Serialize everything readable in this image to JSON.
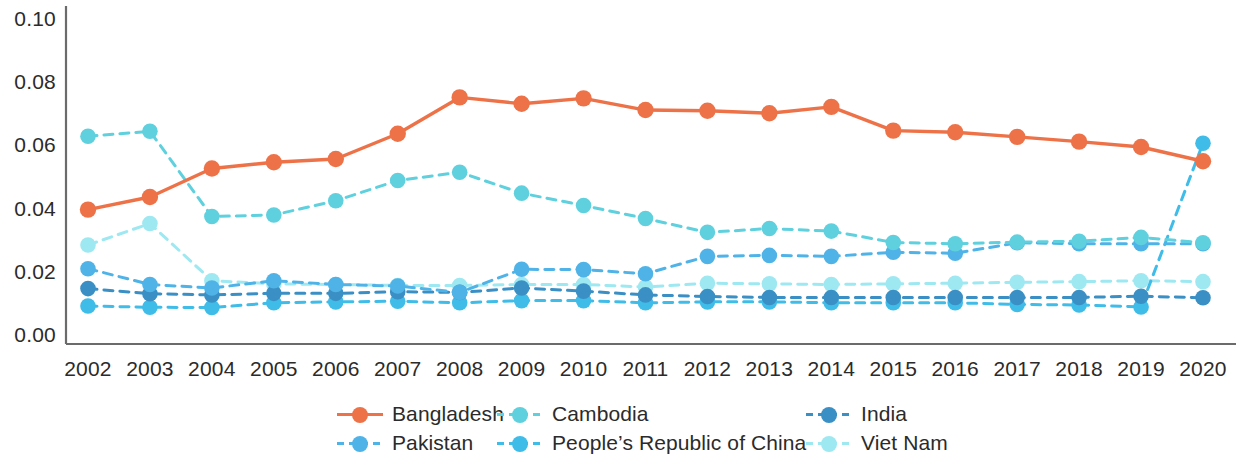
{
  "chart_data": {
    "type": "line",
    "title": "",
    "subtitle": "",
    "xlabel": "",
    "ylabel": "",
    "grid": false,
    "legend_position": "bottom",
    "x": [
      "2002",
      "2003",
      "2004",
      "2005",
      "2006",
      "2007",
      "2008",
      "2009",
      "2010",
      "2011",
      "2012",
      "2013",
      "2014",
      "2015",
      "2016",
      "2017",
      "2018",
      "2019",
      "2020"
    ],
    "categories": [
      "2002",
      "2003",
      "2004",
      "2005",
      "2006",
      "2007",
      "2008",
      "2009",
      "2010",
      "2011",
      "2012",
      "2013",
      "2014",
      "2015",
      "2016",
      "2017",
      "2018",
      "2019",
      "2020"
    ],
    "ylim": [
      0.0,
      0.1
    ],
    "yticks": [
      "0.00",
      "0.02",
      "0.04",
      "0.06",
      "0.08",
      "0.10"
    ],
    "ytick_values": [
      0.0,
      0.02,
      0.04,
      0.06,
      0.08,
      0.1
    ],
    "series": [
      {
        "name": "Bangladesh",
        "color": "#ED7248",
        "style": "solid",
        "values": [
          0.04,
          0.044,
          0.053,
          0.055,
          0.056,
          0.064,
          0.0755,
          0.0735,
          0.0752,
          0.0715,
          0.0713,
          0.0705,
          0.0725,
          0.065,
          0.0645,
          0.063,
          0.0615,
          0.0598,
          0.0553
        ]
      },
      {
        "name": "Cambodia",
        "color": "#5FD0DD",
        "style": "dashed",
        "values": [
          0.0632,
          0.0648,
          0.0378,
          0.0383,
          0.0428,
          0.0492,
          0.0518,
          0.0452,
          0.0413,
          0.0372,
          0.0328,
          0.034,
          0.0332,
          0.0296,
          0.0292,
          0.0297,
          0.03,
          0.0312,
          0.0295
        ]
      },
      {
        "name": "India",
        "color": "#3A8FC4",
        "style": "dashed",
        "values": [
          0.015,
          0.0134,
          0.013,
          0.0135,
          0.0135,
          0.014,
          0.0138,
          0.0152,
          0.0142,
          0.013,
          0.0125,
          0.0122,
          0.0122,
          0.0122,
          0.0122,
          0.0122,
          0.0122,
          0.0126,
          0.0121
        ]
      },
      {
        "name": "Pakistan",
        "color": "#4FB3E8",
        "style": "dashed",
        "values": [
          0.0213,
          0.0163,
          0.0152,
          0.0175,
          0.0163,
          0.0158,
          0.0138,
          0.0211,
          0.021,
          0.0197,
          0.0252,
          0.0255,
          0.0252,
          0.0265,
          0.0262,
          0.0295,
          0.0292,
          0.0292,
          0.0292
        ]
      },
      {
        "name": "People's Republic of China",
        "color": "#3FBCE8",
        "style": "dashed",
        "values": [
          0.0095,
          0.0091,
          0.009,
          0.0105,
          0.0108,
          0.011,
          0.0105,
          0.0112,
          0.0112,
          0.0105,
          0.0108,
          0.0108,
          0.0105,
          0.0105,
          0.0105,
          0.01,
          0.0098,
          0.0092,
          0.061
        ]
      },
      {
        "name": "Viet Nam",
        "color": "#9EE8F2",
        "style": "dashed",
        "values": [
          0.0288,
          0.0356,
          0.0175,
          0.0165,
          0.0163,
          0.016,
          0.016,
          0.0163,
          0.0163,
          0.0155,
          0.0167,
          0.0165,
          0.0163,
          0.0165,
          0.0167,
          0.017,
          0.0172,
          0.0175,
          0.0172
        ]
      }
    ]
  },
  "legend": {
    "rows": [
      [
        {
          "label": "Bangladesh",
          "color": "#ED7248",
          "style": "solid",
          "x": 337,
          "w": 180
        },
        {
          "label": "Cambodia",
          "color": "#5FD0DD",
          "style": "dashed",
          "x": 497,
          "w": 190
        },
        {
          "label": "India",
          "color": "#3A8FC4",
          "style": "dashed",
          "x": 806,
          "w": 140
        }
      ],
      [
        {
          "label": "Pakistan",
          "color": "#4FB3E8",
          "style": "dashed",
          "x": 337,
          "w": 180
        },
        {
          "label": "People’s Republic of China",
          "color": "#3FBCE8",
          "style": "dashed",
          "x": 497,
          "w": 330
        },
        {
          "label": "Viet Nam",
          "color": "#9EE8F2",
          "style": "dashed",
          "x": 806,
          "w": 160
        }
      ]
    ]
  },
  "axis": {
    "axis_color": "#6b6b6b"
  }
}
